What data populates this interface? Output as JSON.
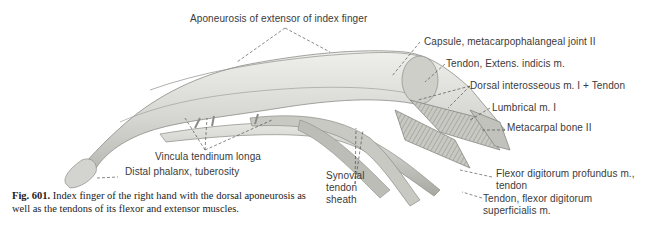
{
  "figure": {
    "number": "Fig. 601.",
    "caption_line1": "Index finger of the right hand with the dorsal aponeurosis",
    "caption_line2": "as well as the tendons of its flexor and extensor muscles."
  },
  "labels": {
    "aponeurosis": "Aponeurosis of extensor of index finger",
    "capsule": "Capsule, metacarpophalangeal joint II",
    "tendon_extens": "Tendon, Extens. indicis m.",
    "dorsal_interosseous": "Dorsal interosseous m. I + Tendon",
    "lumbrical": "Lumbrical m. I",
    "metacarpal": "Metacarpal bone II",
    "vincula": "Vincula tendinum longa",
    "distal_phalanx": "Distal phalanx, tuberosity",
    "synovial_1": "Synovial",
    "synovial_2": "tendon",
    "synovial_3": "sheath",
    "fdp_1": "Flexor digitorum profundus m.,",
    "fdp_2": "tendon",
    "fds_1": "Tendon, flexor digitorum",
    "fds_2": "superficialis m."
  },
  "colors": {
    "ink": "#3a3a3a",
    "finger_fill": "#d9d9d6",
    "finger_shade": "#a9a9a4",
    "background": "#ffffff"
  }
}
